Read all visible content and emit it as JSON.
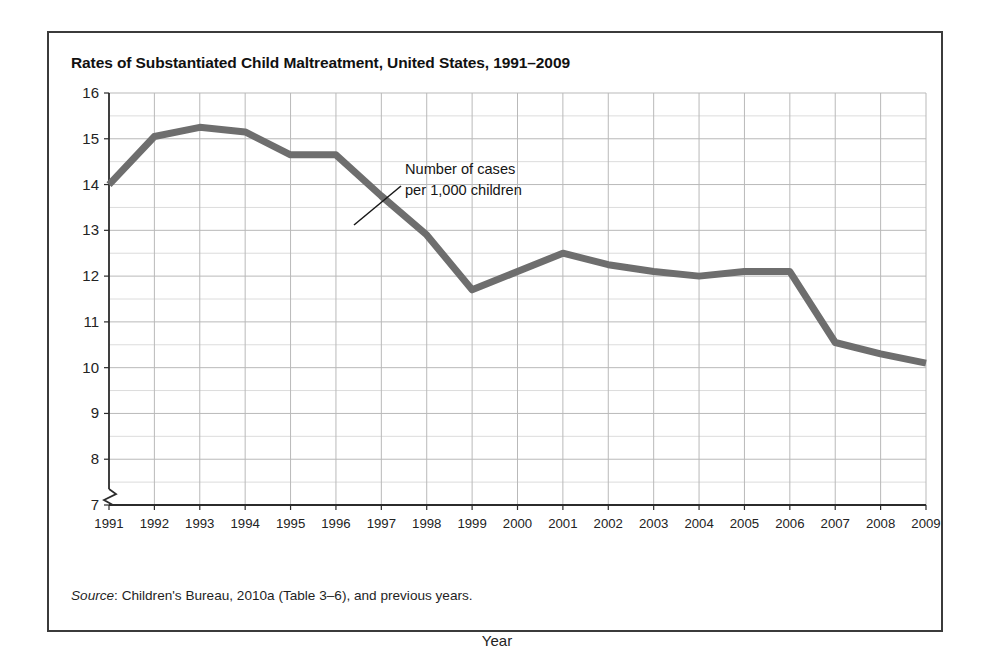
{
  "figure": {
    "title": "Rates of Substantiated Child Maltreatment, United States, 1991–2009",
    "source_label": "Source",
    "source_separator": ":",
    "source_text": " Children's Bureau, 2010a (Table 3–6), and previous years.",
    "frame_color": "#3b3b3b",
    "background_color": "#ffffff"
  },
  "annotation": {
    "line1": "Number of cases",
    "line2": "per 1,000 children"
  },
  "chart_data": {
    "type": "line",
    "title": "Rates of Substantiated Child Maltreatment, United States, 1991–2009",
    "xlabel": "Year",
    "ylabel": "",
    "series_label": "Number of cases per 1,000 children",
    "line_color": "#6e6e6e",
    "grid": true,
    "grid_major_color": "#b9b9b9",
    "grid_minor_color": "#dcdcdc",
    "legend_position": "none",
    "axis_break": true,
    "xlim": [
      1991,
      2009
    ],
    "ylim": [
      7,
      16
    ],
    "categories": [
      "1991",
      "1992",
      "1993",
      "1994",
      "1995",
      "1996",
      "1997",
      "1998",
      "1999",
      "2000",
      "2001",
      "2002",
      "2003",
      "2004",
      "2005",
      "2006",
      "2007",
      "2008",
      "2009"
    ],
    "x": [
      1991,
      1992,
      1993,
      1994,
      1995,
      1996,
      1997,
      1998,
      1999,
      2000,
      2001,
      2002,
      2003,
      2004,
      2005,
      2006,
      2007,
      2008,
      2009
    ],
    "values": [
      14.0,
      15.05,
      15.25,
      15.15,
      14.65,
      14.65,
      13.75,
      12.9,
      11.7,
      12.1,
      12.5,
      12.25,
      12.1,
      12.0,
      12.1,
      12.1,
      10.55,
      10.3,
      10.1
    ],
    "y_ticks": [
      16,
      15,
      14,
      13,
      12,
      11,
      10,
      9,
      8,
      7
    ],
    "y_tick_labels": [
      "16",
      "15",
      "14",
      "13",
      "12",
      "11",
      "10",
      "9",
      "8",
      "7"
    ],
    "x_tick_labels": [
      "1991",
      "1992",
      "1993",
      "1994",
      "1995",
      "1996",
      "1997",
      "1998",
      "1999",
      "2000",
      "2001",
      "2002",
      "2003",
      "2004",
      "2005",
      "2006",
      "2007",
      "2008",
      "2009"
    ]
  }
}
